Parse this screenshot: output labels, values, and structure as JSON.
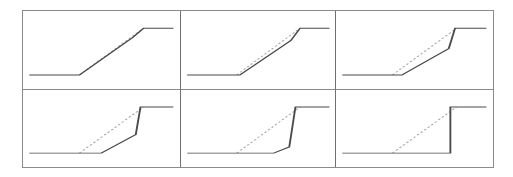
{
  "figure": {
    "title": "",
    "rows": 2,
    "cols": 3,
    "frame_color": "#8a8a8a",
    "divider_color": "#6f6f6f",
    "background": "#ffffff"
  },
  "chart_data": [
    {
      "type": "line",
      "panel_index": 1,
      "panel_name": "panel-1",
      "title": "",
      "xlabel": "",
      "ylabel": "",
      "xlim": [
        0,
        100
      ],
      "ylim": [
        0,
        100
      ],
      "grid": false,
      "legend": "none",
      "series": [
        {
          "name": "reference",
          "style": "dashed",
          "color": "#a8a8a8",
          "x": [
            36,
            77
          ],
          "y": [
            18,
            78
          ]
        },
        {
          "name": "response",
          "style": "solid",
          "color": "#4a4a4a",
          "x": [
            4,
            36,
            70,
            77,
            96
          ],
          "y": [
            18,
            18,
            66,
            78,
            78
          ]
        }
      ]
    },
    {
      "type": "line",
      "panel_index": 2,
      "panel_name": "panel-2",
      "title": "",
      "xlabel": "",
      "ylabel": "",
      "xlim": [
        0,
        100
      ],
      "ylim": [
        0,
        100
      ],
      "grid": false,
      "legend": "none",
      "series": [
        {
          "name": "reference",
          "style": "dashed",
          "color": "#a8a8a8",
          "x": [
            36,
            77
          ],
          "y": [
            18,
            78
          ]
        },
        {
          "name": "response",
          "style": "solid",
          "color": "#4a4a4a",
          "x": [
            4,
            38,
            71,
            77,
            96
          ],
          "y": [
            18,
            18,
            62,
            78,
            78
          ]
        }
      ]
    },
    {
      "type": "line",
      "panel_index": 3,
      "panel_name": "panel-3",
      "title": "",
      "xlabel": "",
      "ylabel": "",
      "xlim": [
        0,
        100
      ],
      "ylim": [
        0,
        100
      ],
      "grid": false,
      "legend": "none",
      "series": [
        {
          "name": "reference",
          "style": "dashed",
          "color": "#a8a8a8",
          "x": [
            36,
            77
          ],
          "y": [
            18,
            78
          ]
        },
        {
          "name": "response",
          "style": "solid",
          "color": "#4a4a4a",
          "x": [
            4,
            42,
            72,
            76,
            96
          ],
          "y": [
            18,
            18,
            52,
            78,
            78
          ]
        }
      ]
    },
    {
      "type": "line",
      "panel_index": 4,
      "panel_name": "panel-4",
      "title": "",
      "xlabel": "",
      "ylabel": "",
      "xlim": [
        0,
        100
      ],
      "ylim": [
        0,
        100
      ],
      "grid": false,
      "legend": "none",
      "series": [
        {
          "name": "reference",
          "style": "dashed",
          "color": "#a8a8a8",
          "x": [
            36,
            77
          ],
          "y": [
            18,
            78
          ]
        },
        {
          "name": "response",
          "style": "solid",
          "color": "#4a4a4a",
          "x": [
            4,
            50,
            72,
            75,
            96
          ],
          "y": [
            18,
            18,
            42,
            78,
            78
          ]
        }
      ]
    },
    {
      "type": "line",
      "panel_index": 5,
      "panel_name": "panel-5",
      "title": "",
      "xlabel": "",
      "ylabel": "",
      "xlim": [
        0,
        100
      ],
      "ylim": [
        0,
        100
      ],
      "grid": false,
      "legend": "none",
      "series": [
        {
          "name": "reference",
          "style": "dashed",
          "color": "#a8a8a8",
          "x": [
            36,
            77
          ],
          "y": [
            18,
            78
          ]
        },
        {
          "name": "response",
          "style": "solid",
          "color": "#4a4a4a",
          "x": [
            4,
            60,
            70,
            74,
            96
          ],
          "y": [
            18,
            18,
            26,
            78,
            78
          ]
        }
      ]
    },
    {
      "type": "line",
      "panel_index": 6,
      "panel_name": "panel-6",
      "title": "",
      "xlabel": "",
      "ylabel": "",
      "xlim": [
        0,
        100
      ],
      "ylim": [
        0,
        100
      ],
      "grid": false,
      "legend": "none",
      "series": [
        {
          "name": "reference",
          "style": "dashed",
          "color": "#a8a8a8",
          "x": [
            36,
            77
          ],
          "y": [
            18,
            78
          ]
        },
        {
          "name": "response",
          "style": "solid",
          "color": "#4a4a4a",
          "x": [
            4,
            73,
            73,
            96
          ],
          "y": [
            18,
            18,
            78,
            78
          ]
        }
      ]
    }
  ]
}
